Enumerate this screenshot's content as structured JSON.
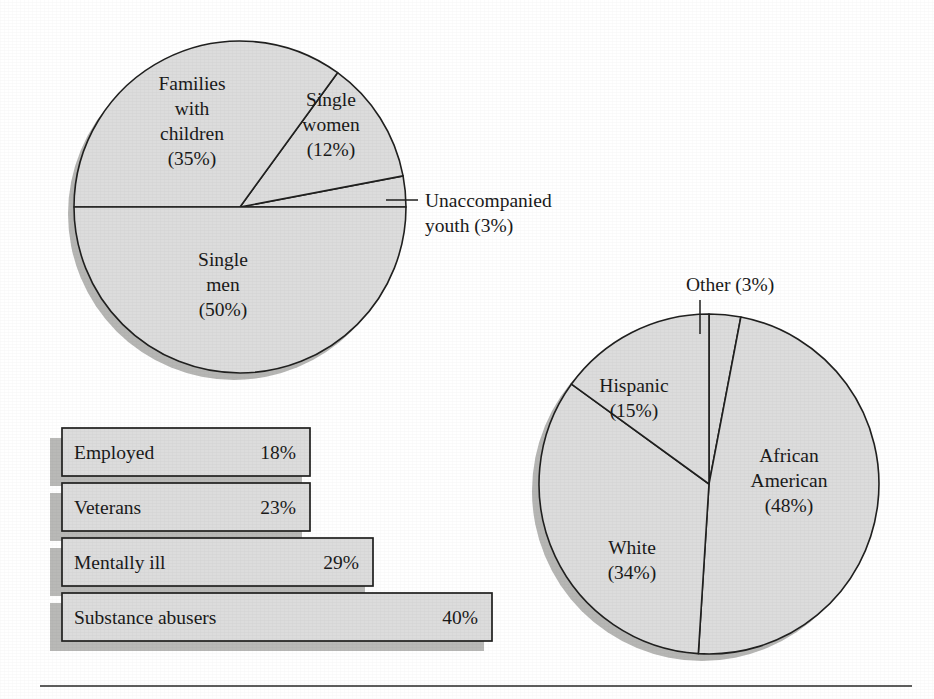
{
  "figure": {
    "background_color": "#ffffff",
    "ink_color": "#1a1a1a",
    "fill_color": "#dcdcdc",
    "shadow_color": "#b6b6b4",
    "rule_label": "figure-bottom-rule"
  },
  "chart_data": [
    {
      "id": "household-composition-pie",
      "type": "pie",
      "title": "",
      "legend_position": "inside-slices",
      "center": [
        240,
        207
      ],
      "radius": 166,
      "start_angle_deg": 0,
      "direction": "counterclockwise",
      "labels": [
        "Unaccompanied youth",
        "Single women",
        "Families with children",
        "Single men"
      ],
      "values": [
        3,
        12,
        35,
        50
      ],
      "slices": [
        {
          "name": "Unaccompanied youth",
          "value": 3,
          "label_lines": [
            "Unaccompanied",
            "youth (3%)"
          ],
          "label_text": "Unaccompanied youth (3%)",
          "label_placement": "callout-right",
          "label_xy": [
            425,
            207
          ],
          "leader_from": [
            386,
            200
          ],
          "leader_to": [
            418,
            200
          ]
        },
        {
          "name": "Single women",
          "value": 12,
          "label_lines": [
            "Single",
            "women",
            "(12%)"
          ],
          "label_text": "Single women (12%)",
          "label_placement": "inside",
          "label_xy": [
            331,
            106
          ]
        },
        {
          "name": "Families with children",
          "value": 35,
          "label_lines": [
            "Families",
            "with",
            "children",
            "(35%)"
          ],
          "label_text": "Families with children (35%)",
          "label_placement": "inside",
          "label_xy": [
            192,
            90
          ]
        },
        {
          "name": "Single men",
          "value": 50,
          "label_lines": [
            "Single",
            "men",
            "(50%)"
          ],
          "label_text": "Single men (50%)",
          "label_placement": "inside",
          "label_xy": [
            223,
            266
          ]
        }
      ]
    },
    {
      "id": "characteristics-bar-chart",
      "type": "bar",
      "orientation": "horizontal",
      "title": "",
      "xlabel": "",
      "ylabel": "",
      "xlim": [
        0,
        50
      ],
      "grid": false,
      "axis_visible": false,
      "origin_x": 62,
      "top_y": 428,
      "bar_height": 48,
      "bar_gap": 7,
      "px_per_percent": 10.75,
      "categories": [
        "Employed",
        "Veterans",
        "Mentally ill",
        "Substance abusers"
      ],
      "values": [
        18,
        23,
        29,
        40
      ],
      "value_labels": [
        "18%",
        "23%",
        "29%",
        "40%"
      ],
      "bars": [
        {
          "label": "Employed",
          "value": 18,
          "value_label": "18%",
          "pixel_width": 248
        },
        {
          "label": "Veterans",
          "value": 23,
          "value_label": "23%",
          "pixel_width": 248
        },
        {
          "label": "Mentally ill",
          "value": 29,
          "value_label": "29%",
          "pixel_width": 311
        },
        {
          "label": "Substance abusers",
          "value": 40,
          "value_label": "40%",
          "pixel_width": 430
        }
      ]
    },
    {
      "id": "race-ethnicity-pie",
      "type": "pie",
      "title": "",
      "legend_position": "inside-slices",
      "center": [
        709,
        484
      ],
      "radius": 170,
      "start_angle_deg": 90,
      "direction": "clockwise",
      "labels": [
        "Other",
        "African American",
        "White",
        "Hispanic"
      ],
      "values": [
        3,
        48,
        34,
        15
      ],
      "slices": [
        {
          "name": "Other",
          "value": 3,
          "label_lines": [
            "Other (3%)"
          ],
          "label_text": "Other (3%)",
          "label_placement": "callout-above",
          "label_xy": [
            686,
            291
          ],
          "leader_from": [
            700,
            300
          ],
          "leader_to": [
            700,
            334
          ]
        },
        {
          "name": "African American",
          "value": 48,
          "label_lines": [
            "African",
            "American",
            "(48%)"
          ],
          "label_text": "African American (48%)",
          "label_placement": "inside",
          "label_xy": [
            789,
            462
          ]
        },
        {
          "name": "White",
          "value": 34,
          "label_lines": [
            "White",
            "(34%)"
          ],
          "label_text": "White (34%)",
          "label_placement": "inside",
          "label_xy": [
            632,
            554
          ]
        },
        {
          "name": "Hispanic",
          "value": 15,
          "label_lines": [
            "Hispanic",
            "(15%)"
          ],
          "label_text": "Hispanic (15%)",
          "label_placement": "inside",
          "label_xy": [
            634,
            392
          ]
        }
      ]
    }
  ]
}
